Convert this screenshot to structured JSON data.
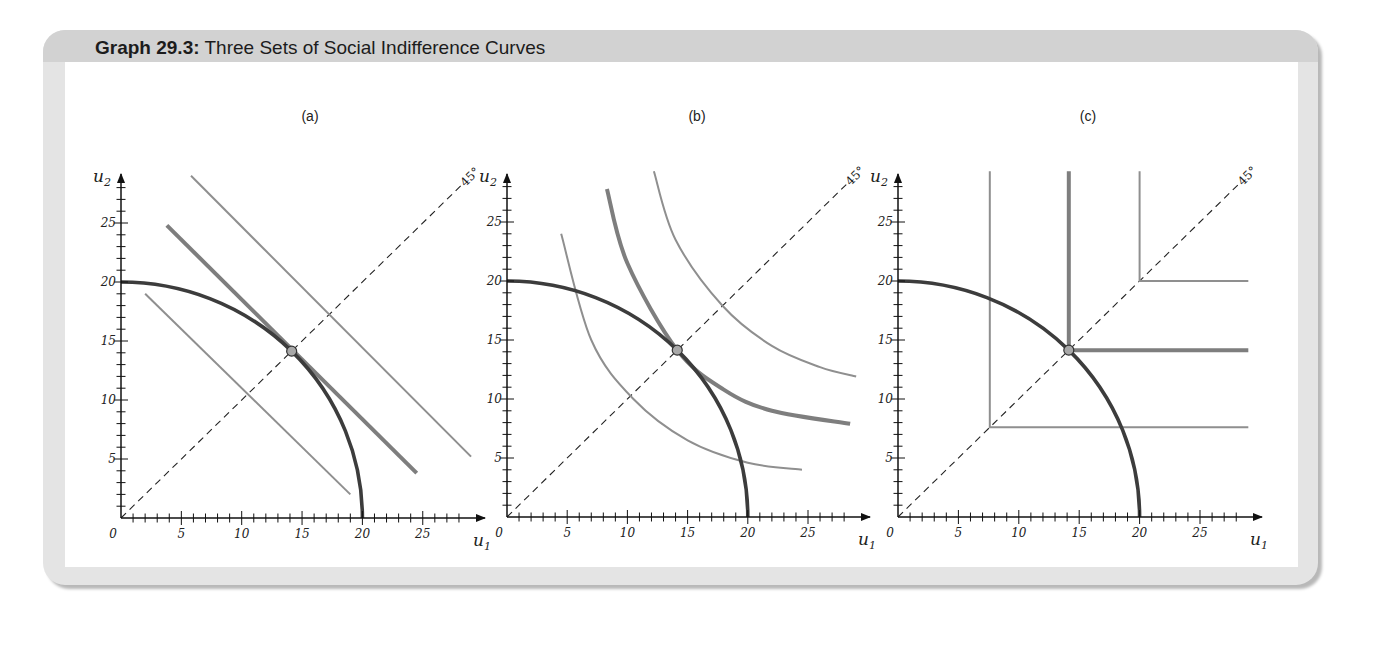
{
  "header": {
    "title_bold": "Graph 29.3:",
    "title_rest": " Three Sets of Social Indifference Curves"
  },
  "colors": {
    "frame_bg": "#e4e4e4",
    "header_bg": "#d2d2d2",
    "upf_curve": "#3c3c3c",
    "indifference_curve": "#8a8a8a",
    "optimal_point_fill": "#a8a8a8"
  },
  "panels": [
    {
      "label": "(a)",
      "xlabel": "u1",
      "ylabel": "u2",
      "diag_label": "45°"
    },
    {
      "label": "(b)",
      "xlabel": "u1",
      "ylabel": "u2",
      "diag_label": "45°"
    },
    {
      "label": "(c)",
      "xlabel": "u1",
      "ylabel": "u2",
      "diag_label": "45°"
    }
  ],
  "chart_data": [
    {
      "type": "line",
      "title": "(a)",
      "xlabel": "u1",
      "ylabel": "u2",
      "xlim": [
        0,
        29
      ],
      "ylim": [
        0,
        29
      ],
      "xticks": [
        0,
        5,
        10,
        15,
        20,
        25
      ],
      "yticks": [
        5,
        10,
        15,
        20,
        25
      ],
      "series": [
        {
          "name": "Utility possibility frontier",
          "kind": "quarter-circle",
          "radius": 20,
          "style": "thick-dark"
        },
        {
          "name": "45° line",
          "points": [
            [
              0,
              0
            ],
            [
              28.5,
              28.5
            ]
          ],
          "style": "dashed"
        },
        {
          "name": "Indifference line (low)",
          "points": [
            [
              2,
              19
            ],
            [
              19,
              2
            ]
          ],
          "style": "thin-gray"
        },
        {
          "name": "Indifference line (optimal)",
          "points": [
            [
              3.8,
              24.8
            ],
            [
              24.5,
              3.8
            ]
          ],
          "style": "thick-gray"
        },
        {
          "name": "Indifference line (high)",
          "points": [
            [
              5.8,
              29
            ],
            [
              29,
              5.2
            ]
          ],
          "style": "thin-gray"
        }
      ],
      "annotations": [
        {
          "text": "optimal point",
          "x": 14.14,
          "y": 14.14
        },
        {
          "text": "45°",
          "x": 27,
          "y": 27
        }
      ]
    },
    {
      "type": "line",
      "title": "(b)",
      "xlabel": "u1",
      "ylabel": "u2",
      "xlim": [
        0,
        29
      ],
      "ylim": [
        0,
        29
      ],
      "xticks": [
        0,
        5,
        10,
        15,
        20,
        25
      ],
      "yticks": [
        5,
        10,
        15,
        20,
        25
      ],
      "series": [
        {
          "name": "Utility possibility frontier",
          "kind": "quarter-circle",
          "radius": 20,
          "style": "thick-dark"
        },
        {
          "name": "45° line",
          "points": [
            [
              0,
              0
            ],
            [
              28.5,
              28.5
            ]
          ],
          "style": "dashed"
        },
        {
          "name": "Indifference curve (low)",
          "points": [
            [
              4.5,
              24
            ],
            [
              7,
              15
            ],
            [
              10.5,
              10
            ],
            [
              15,
              6.5
            ],
            [
              20,
              4.6
            ],
            [
              24.5,
              4
            ]
          ],
          "style": "thin-gray"
        },
        {
          "name": "Indifference curve (optimal)",
          "points": [
            [
              8.3,
              27.8
            ],
            [
              10,
              21.5
            ],
            [
              14.14,
              14.14
            ],
            [
              18,
              10.8
            ],
            [
              22,
              9
            ],
            [
              28.5,
              7.9
            ]
          ],
          "style": "thick-gray"
        },
        {
          "name": "Indifference curve (high)",
          "points": [
            [
              12.2,
              30
            ],
            [
              14,
              23.5
            ],
            [
              17.9,
              17.9
            ],
            [
              22,
              14.5
            ],
            [
              26,
              12.7
            ],
            [
              29,
              11.9
            ]
          ],
          "style": "thin-gray"
        }
      ],
      "annotations": [
        {
          "text": "optimal point",
          "x": 14.14,
          "y": 14.14
        },
        {
          "text": "45°",
          "x": 27,
          "y": 27
        }
      ]
    },
    {
      "type": "line",
      "title": "(c)",
      "xlabel": "u1",
      "ylabel": "u2",
      "xlim": [
        0,
        29
      ],
      "ylim": [
        0,
        29
      ],
      "xticks": [
        0,
        5,
        10,
        15,
        20,
        25
      ],
      "yticks": [
        5,
        10,
        15,
        20,
        25
      ],
      "series": [
        {
          "name": "Utility possibility frontier",
          "kind": "quarter-circle",
          "radius": 20,
          "style": "thick-dark"
        },
        {
          "name": "45° line",
          "points": [
            [
              0,
              0
            ],
            [
              28.5,
              28.5
            ]
          ],
          "style": "dashed"
        },
        {
          "name": "L-shaped curve (low)",
          "points": [
            [
              7.6,
              30
            ],
            [
              7.6,
              7.6
            ],
            [
              29,
              7.6
            ]
          ],
          "style": "thin-gray"
        },
        {
          "name": "L-shaped curve (optimal)",
          "points": [
            [
              14.14,
              30
            ],
            [
              14.14,
              14.14
            ],
            [
              29,
              14.14
            ]
          ],
          "style": "thick-gray"
        },
        {
          "name": "L-shaped curve (high)",
          "points": [
            [
              20,
              30
            ],
            [
              20,
              20
            ],
            [
              29,
              20
            ]
          ],
          "style": "thin-gray"
        }
      ],
      "annotations": [
        {
          "text": "optimal point",
          "x": 14.14,
          "y": 14.14
        },
        {
          "text": "45°",
          "x": 27,
          "y": 27
        }
      ]
    }
  ]
}
